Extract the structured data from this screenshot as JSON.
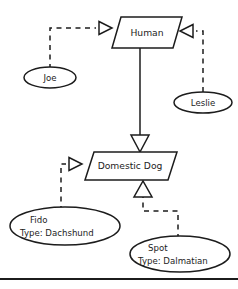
{
  "diagram": {
    "classes": [
      {
        "id": "human",
        "label": "Human",
        "shape": "parallelogram"
      },
      {
        "id": "domestic-dog",
        "label": "Domestic Dog",
        "shape": "parallelogram"
      }
    ],
    "instances": [
      {
        "id": "joe",
        "shape": "ellipse",
        "line1": "Joe",
        "line2": ""
      },
      {
        "id": "leslie",
        "shape": "ellipse",
        "line1": "Leslie",
        "line2": ""
      },
      {
        "id": "fido",
        "shape": "ellipse",
        "line1": "Fido",
        "line2": "Type: Dachshund"
      },
      {
        "id": "spot",
        "shape": "ellipse",
        "line1": "Spot",
        "line2": "Type: Dalmatian"
      }
    ],
    "links": [
      {
        "id": "joe-human",
        "from": "joe",
        "to": "human",
        "style": "dashed",
        "arrow": "hollow-triangle"
      },
      {
        "id": "leslie-human",
        "from": "leslie",
        "to": "human",
        "style": "dashed",
        "arrow": "hollow-triangle"
      },
      {
        "id": "human-domestic-dog",
        "from": "human",
        "to": "domestic-dog",
        "style": "solid",
        "arrow": "hollow-triangle"
      },
      {
        "id": "fido-domestic-dog",
        "from": "fido",
        "to": "domestic-dog",
        "style": "dashed",
        "arrow": "hollow-triangle"
      },
      {
        "id": "spot-domestic-dog",
        "from": "spot",
        "to": "domestic-dog",
        "style": "dashed",
        "arrow": "hollow-triangle"
      }
    ],
    "colors": {
      "stroke": "#1c1c1c",
      "fill": "#ffffff",
      "background": "#ffffff"
    }
  }
}
